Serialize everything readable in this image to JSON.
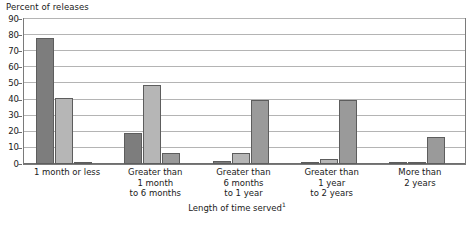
{
  "chart_data": {
    "type": "bar",
    "title": "",
    "ylabel": "Percent of releases",
    "xlabel": "Length of time served",
    "xlabel_footnote": "1",
    "ylim": [
      0,
      90
    ],
    "y_ticks": [
      0,
      10,
      20,
      30,
      40,
      50,
      60,
      70,
      80,
      90
    ],
    "grid": true,
    "legend_position": "none",
    "categories": [
      "1 month or less",
      "Greater than 1 month to 6 months",
      "Greater than 6 months to 1 year",
      "Greater than 1 year to 2 years",
      "More than 2 years"
    ],
    "category_lines": [
      [
        "1 month or less"
      ],
      [
        "Greater than",
        "1 month",
        "to 6 months"
      ],
      [
        "Greater than",
        "6 months",
        "to 1 year"
      ],
      [
        "Greater than",
        "1 year",
        "to 2 years"
      ],
      [
        "More than",
        "2 years"
      ]
    ],
    "series": [
      {
        "name": "Series 1",
        "color": "#7d7d7d",
        "values": [
          78,
          19,
          2,
          1,
          0.5
        ]
      },
      {
        "name": "Series 2",
        "color": "#b6b6b6",
        "values": [
          41,
          49,
          7,
          3,
          1
        ]
      },
      {
        "name": "Series 3",
        "color": "#9a9a9a",
        "values": [
          1,
          7,
          40,
          40,
          17
        ]
      }
    ]
  }
}
